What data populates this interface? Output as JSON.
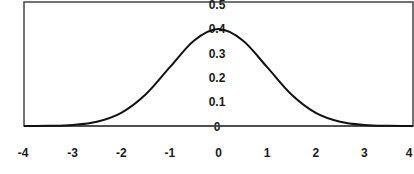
{
  "chart_data": {
    "type": "line",
    "title": "",
    "xlabel": "",
    "ylabel": "",
    "xlim": [
      -4,
      4
    ],
    "ylim": [
      0,
      0.5
    ],
    "grid": false,
    "legend": null,
    "x_ticks": [
      "-4",
      "-3",
      "-2",
      "-1",
      "0",
      "1",
      "2",
      "3",
      "4"
    ],
    "y_ticks": [
      "0",
      "0.1",
      "0.2",
      "0.3",
      "0.4",
      "0.5"
    ],
    "series": [
      {
        "name": "Standard normal density",
        "x": [
          -4,
          -3.5,
          -3,
          -2.5,
          -2,
          -1.5,
          -1,
          -0.5,
          0,
          0.5,
          1,
          1.5,
          2,
          2.5,
          3,
          3.5,
          4
        ],
        "values": [
          0.0001,
          0.0009,
          0.0044,
          0.0175,
          0.054,
          0.1295,
          0.242,
          0.3521,
          0.3989,
          0.3521,
          0.242,
          0.1295,
          0.054,
          0.0175,
          0.0044,
          0.0009,
          0.0001
        ]
      }
    ],
    "line_color": "#111111"
  }
}
